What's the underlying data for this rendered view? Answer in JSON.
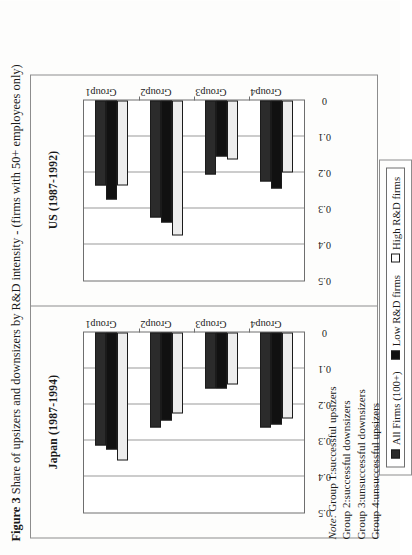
{
  "figure": {
    "label": "Figure 3",
    "caption": "Share of upsizers and downsizers by R&D intensity - (firms with 50+ employees only)",
    "full_caption": "Figure 3 Share of upsizers and downsizers by R&D intensity - (firms with 50+ employees only)"
  },
  "legend": {
    "entries": [
      {
        "label": "All Firms (100+)",
        "series_key": "all",
        "color": "#2b2b2b"
      },
      {
        "label": "Low R&D firms",
        "series_key": "low",
        "color": "#111111"
      },
      {
        "label": "High R&D firms",
        "series_key": "high",
        "color": "#ededed"
      }
    ]
  },
  "notes": {
    "note_word": "Note:",
    "lines": [
      "Note: Group 1:successful upsizers",
      "Group 2:successful downsizers",
      "Group 3:unsuccessful downsizers",
      "Group 4:unsuccessful upsizers"
    ]
  },
  "axis": {
    "tick_labels": [
      "0.5",
      "0.4",
      "0.3",
      "0.2",
      "0.1",
      "0"
    ],
    "tick_values": [
      0.5,
      0.4,
      0.3,
      0.2,
      0.1,
      0
    ],
    "categories": [
      "Group1",
      "Group2",
      "Group3",
      "Group4"
    ],
    "xlim": [
      0,
      0.5
    ]
  },
  "chart_data": [
    {
      "type": "bar",
      "orientation": "horizontal",
      "title": "Japan (1987-1994)",
      "xlabel": "",
      "ylabel": "",
      "xlim": [
        0,
        0.5
      ],
      "grid": true,
      "legend_position": "bottom",
      "categories": [
        "Group1",
        "Group2",
        "Group3",
        "Group4"
      ],
      "series": [
        {
          "name": "All Firms (100+)",
          "values": [
            0.315,
            0.265,
            0.155,
            0.265
          ]
        },
        {
          "name": "Low R&D firms",
          "values": [
            0.325,
            0.245,
            0.155,
            0.255
          ]
        },
        {
          "name": "High R&D firms",
          "values": [
            0.355,
            0.225,
            0.145,
            0.24
          ]
        }
      ]
    },
    {
      "type": "bar",
      "orientation": "horizontal",
      "title": "US (1987-1992)",
      "xlabel": "",
      "ylabel": "",
      "xlim": [
        0,
        0.5
      ],
      "grid": true,
      "legend_position": "bottom",
      "categories": [
        "Group1",
        "Group2",
        "Group3",
        "Group4"
      ],
      "series": [
        {
          "name": "All Firms (100+)",
          "values": [
            0.235,
            0.325,
            0.205,
            0.225
          ]
        },
        {
          "name": "Low R&D firms",
          "values": [
            0.275,
            0.34,
            0.155,
            0.245
          ]
        },
        {
          "name": "High R&D firms",
          "values": [
            0.235,
            0.375,
            0.165,
            0.2
          ]
        }
      ]
    }
  ]
}
